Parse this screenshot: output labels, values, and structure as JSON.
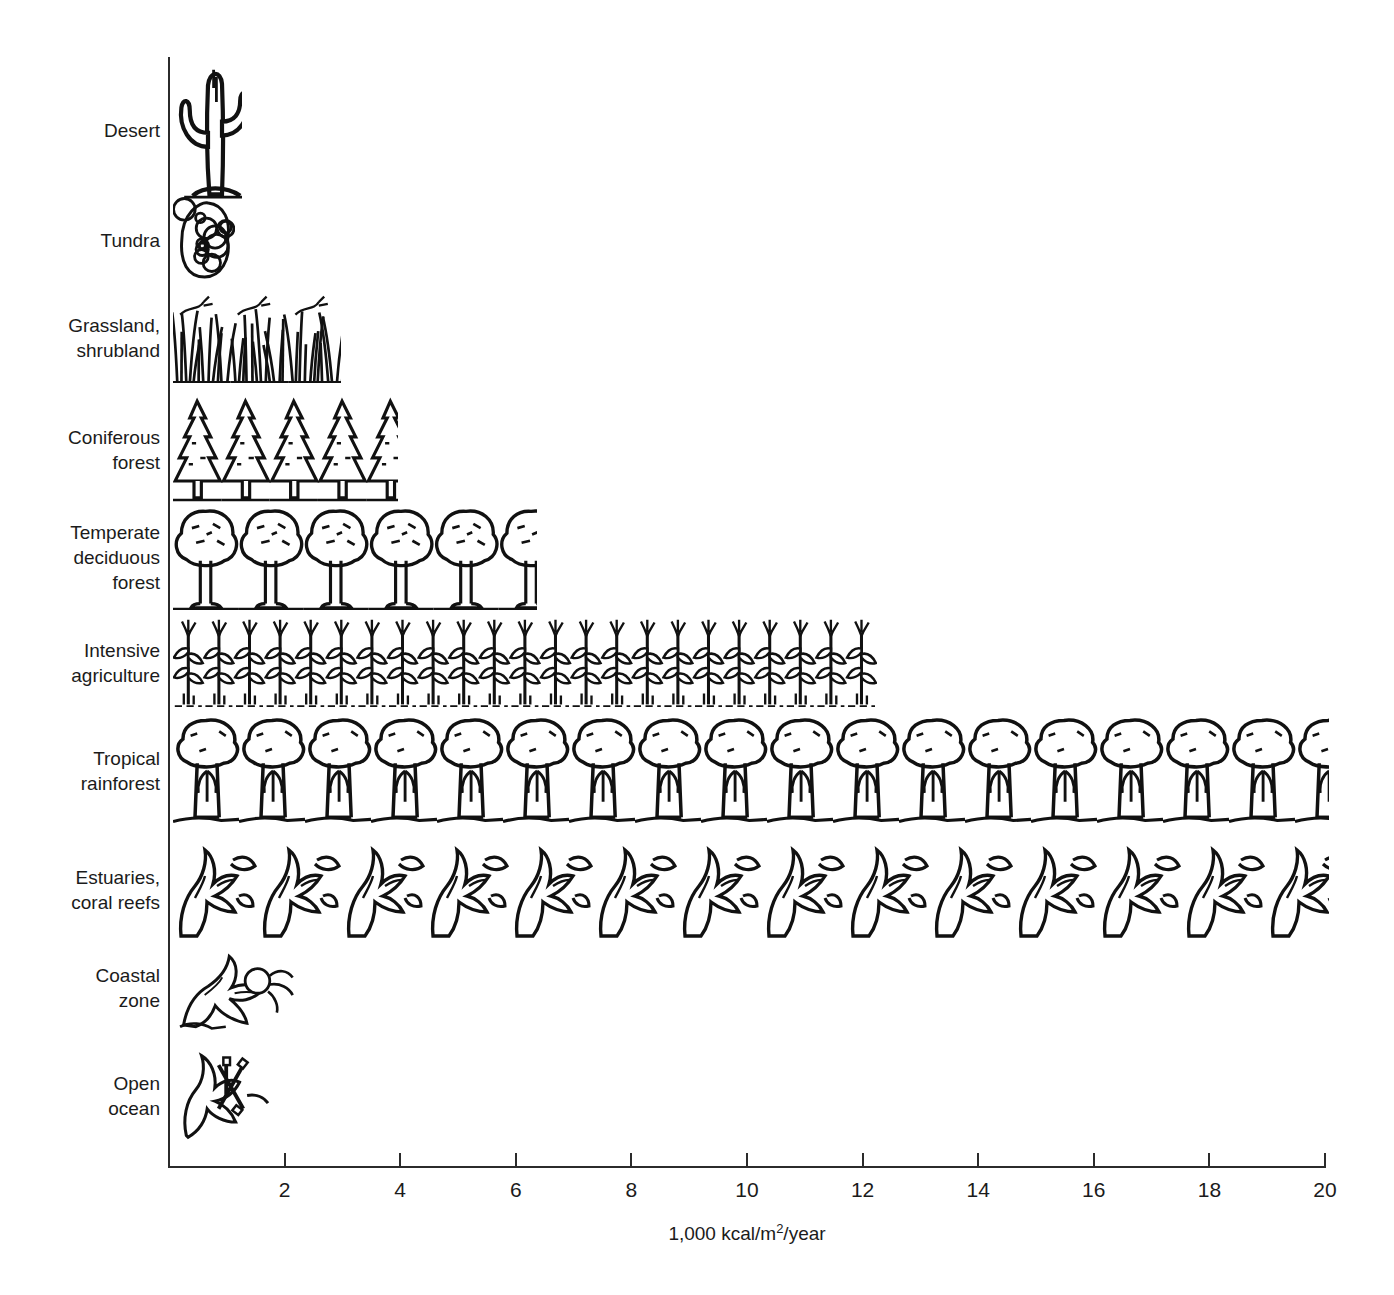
{
  "chart_data": {
    "type": "bar",
    "title": "",
    "subtitle": "",
    "xlabel": "1,000 kcal/m2/year",
    "xlabel_prefix": "1,000 kcal/m",
    "xlabel_sup": "2",
    "xlabel_suffix": "/year",
    "ylabel": "",
    "orientation": "horizontal",
    "xlim": [
      0,
      20
    ],
    "xticks": [
      2,
      4,
      6,
      8,
      10,
      12,
      14,
      16,
      18,
      20
    ],
    "xtick_labels": [
      "2",
      "4",
      "6",
      "8",
      "10",
      "12",
      "14",
      "16",
      "18",
      "20"
    ],
    "grid": false,
    "legend": null,
    "units": "1,000 kcal/m2/year",
    "style": "pictorial bars drawn as repeating black-and-white line-art vegetation motifs",
    "categories": [
      "Desert",
      "Tundra",
      "Grassland, shrubland",
      "Coniferous forest",
      "Temperate deciduous forest",
      "Intensive agriculture",
      "Tropical rainforest",
      "Estuaries, coral reefs",
      "Coastal zone",
      "Open ocean"
    ],
    "values": [
      1.2,
      1.5,
      2.9,
      3.9,
      6.3,
      12.3,
      20.0,
      20.0,
      3.0,
      2.2
    ],
    "bars": [
      {
        "label": "Desert",
        "label_lines": [
          "Desert"
        ],
        "value": 1.2,
        "motif": "cactus"
      },
      {
        "label": "Tundra",
        "label_lines": [
          "Tundra"
        ],
        "value": 1.5,
        "motif": "lichen"
      },
      {
        "label": "Grassland, shrubland",
        "label_lines": [
          "Grassland,",
          "shrubland"
        ],
        "value": 2.9,
        "motif": "grass"
      },
      {
        "label": "Coniferous forest",
        "label_lines": [
          "Coniferous",
          "forest"
        ],
        "value": 3.9,
        "motif": "conifer"
      },
      {
        "label": "Temperate deciduous forest",
        "label_lines": [
          "Temperate",
          "deciduous",
          "forest"
        ],
        "value": 6.3,
        "motif": "deciduous"
      },
      {
        "label": "Intensive agriculture",
        "label_lines": [
          "Intensive",
          "agriculture"
        ],
        "value": 12.3,
        "motif": "corn"
      },
      {
        "label": "Tropical rainforest",
        "label_lines": [
          "Tropical",
          "rainforest"
        ],
        "value": 20.0,
        "motif": "rainforest"
      },
      {
        "label": "Estuaries, coral reefs",
        "label_lines": [
          "Estuaries,",
          "coral reefs"
        ],
        "value": 20.0,
        "motif": "seaweed"
      },
      {
        "label": "Coastal zone",
        "label_lines": [
          "Coastal",
          "zone"
        ],
        "value": 3.0,
        "motif": "kelp"
      },
      {
        "label": "Open ocean",
        "label_lines": [
          "Open",
          "ocean"
        ],
        "value": 2.2,
        "motif": "plankton"
      }
    ]
  },
  "colors": {
    "ink": "#1b1b1b",
    "axis": "#2b2b2b",
    "background": "#ffffff"
  }
}
